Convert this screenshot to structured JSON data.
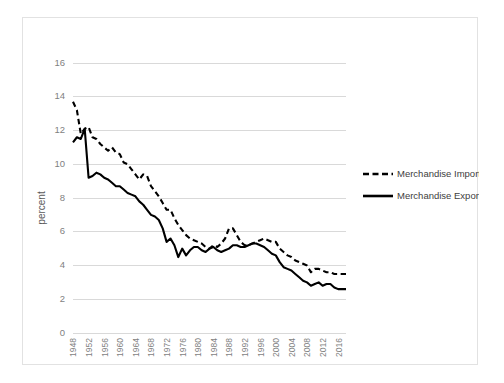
{
  "chart_data": {
    "type": "line",
    "title": "",
    "xlabel": "",
    "ylabel": "percent",
    "ylim": [
      0,
      16
    ],
    "ytick_step": 2,
    "yticks": [
      "0",
      "2",
      "4",
      "6",
      "8",
      "10",
      "12",
      "14",
      "16"
    ],
    "grid": true,
    "legend_position": "right",
    "xtick_labels": [
      "1948",
      "1952",
      "1956",
      "1960",
      "1964",
      "1968",
      "1972",
      "1976",
      "1980",
      "1984",
      "1988",
      "1992",
      "1996",
      "2000",
      "2004",
      "2008",
      "2012",
      "2016"
    ],
    "xtick_step": 4,
    "x": [
      1948,
      1949,
      1950,
      1951,
      1952,
      1953,
      1954,
      1955,
      1956,
      1957,
      1958,
      1959,
      1960,
      1961,
      1962,
      1963,
      1964,
      1965,
      1966,
      1967,
      1968,
      1969,
      1970,
      1971,
      1972,
      1973,
      1974,
      1975,
      1976,
      1977,
      1978,
      1979,
      1980,
      1981,
      1982,
      1983,
      1984,
      1985,
      1986,
      1987,
      1988,
      1989,
      1990,
      1991,
      1992,
      1993,
      1994,
      1995,
      1996,
      1997,
      1998,
      1999,
      2000,
      2001,
      2002,
      2003,
      2004,
      2005,
      2006,
      2007,
      2008,
      2009,
      2010,
      2011,
      2012,
      2013,
      2014,
      2015,
      2016,
      2017,
      2018
    ],
    "series": [
      {
        "name": "Merchandise Imports",
        "style": "dashed",
        "color": "#000000",
        "values": [
          13.7,
          13.2,
          11.8,
          12.1,
          12.2,
          11.6,
          11.5,
          11.2,
          11.0,
          10.8,
          11.0,
          10.7,
          10.6,
          10.1,
          10.0,
          9.7,
          9.4,
          9.1,
          9.4,
          9.3,
          8.7,
          8.4,
          8.1,
          7.7,
          7.3,
          7.3,
          6.8,
          6.4,
          6.1,
          5.8,
          5.6,
          5.5,
          5.4,
          5.3,
          5.1,
          5.0,
          5.2,
          5.1,
          5.3,
          5.6,
          6.2,
          6.2,
          5.8,
          5.4,
          5.2,
          5.2,
          5.3,
          5.4,
          5.5,
          5.6,
          5.5,
          5.4,
          5.4,
          5.0,
          4.8,
          4.6,
          4.5,
          4.3,
          4.2,
          4.1,
          4.0,
          3.6,
          3.8,
          3.8,
          3.7,
          3.6,
          3.6,
          3.5,
          3.5,
          3.5,
          3.5
        ]
      },
      {
        "name": "Merchandise Exports",
        "style": "solid",
        "color": "#000000",
        "values": [
          11.3,
          11.6,
          11.5,
          12.1,
          9.2,
          9.3,
          9.5,
          9.4,
          9.2,
          9.1,
          8.9,
          8.7,
          8.7,
          8.5,
          8.3,
          8.2,
          8.1,
          7.8,
          7.6,
          7.3,
          7.0,
          6.9,
          6.7,
          6.2,
          5.4,
          5.6,
          5.2,
          4.5,
          5.0,
          4.6,
          4.9,
          5.1,
          5.1,
          4.9,
          4.8,
          5.0,
          5.1,
          4.9,
          4.8,
          4.9,
          5.0,
          5.2,
          5.2,
          5.1,
          5.1,
          5.2,
          5.3,
          5.3,
          5.2,
          5.1,
          4.9,
          4.7,
          4.6,
          4.2,
          3.9,
          3.8,
          3.7,
          3.5,
          3.3,
          3.1,
          3.0,
          2.8,
          2.9,
          3.0,
          2.8,
          2.9,
          2.9,
          2.7,
          2.6,
          2.6,
          2.6
        ]
      }
    ]
  },
  "legend": {
    "entries": [
      {
        "label": "Merchandise Imports",
        "style": "dashed"
      },
      {
        "label": "Merchandise Exports",
        "style": "solid"
      }
    ]
  },
  "axis": {
    "y_title": "percent"
  }
}
